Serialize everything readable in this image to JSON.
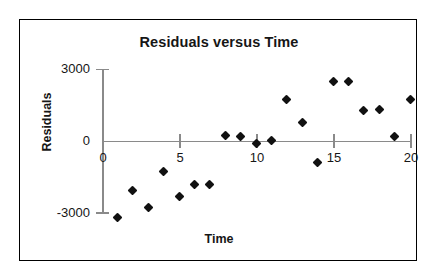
{
  "chart_data": {
    "type": "scatter",
    "title": "Residuals versus Time",
    "xlabel": "Time",
    "ylabel": "Residuals",
    "xlim": [
      0,
      20
    ],
    "ylim": [
      -3000,
      3000
    ],
    "grid": false,
    "legend": null,
    "xticks": [
      0,
      5,
      10,
      15,
      20
    ],
    "xtick_labels": [
      "0",
      "5",
      "10",
      "15",
      "20"
    ],
    "yticks": [
      -3000,
      0,
      3000
    ],
    "ytick_labels": [
      "3000",
      "0",
      "-3000"
    ],
    "series_name": "Residuals",
    "marker": "diamond",
    "marker_color": "#111111",
    "axis_color": "#8a8a8a",
    "points": [
      {
        "x": 1,
        "y": -3170
      },
      {
        "x": 2,
        "y": -2040
      },
      {
        "x": 3,
        "y": -2750
      },
      {
        "x": 4,
        "y": -1250
      },
      {
        "x": 5,
        "y": -2290
      },
      {
        "x": 6,
        "y": -1790
      },
      {
        "x": 7,
        "y": -1790
      },
      {
        "x": 8,
        "y": 250
      },
      {
        "x": 9,
        "y": 210
      },
      {
        "x": 10,
        "y": -80
      },
      {
        "x": 11,
        "y": 40
      },
      {
        "x": 12,
        "y": 1750
      },
      {
        "x": 13,
        "y": 790
      },
      {
        "x": 14,
        "y": -880
      },
      {
        "x": 15,
        "y": 2500
      },
      {
        "x": 16,
        "y": 2500
      },
      {
        "x": 17,
        "y": 1290
      },
      {
        "x": 18,
        "y": 1330
      },
      {
        "x": 19,
        "y": 210
      },
      {
        "x": 20,
        "y": 1750
      }
    ]
  },
  "chart": {
    "title": "Residuals versus Time",
    "xlabel": "Time",
    "ylabel": "Residuals",
    "ytick_labels": [
      "3000",
      "0",
      "-3000"
    ],
    "xtick_labels": [
      "0",
      "5",
      "10",
      "15",
      "20"
    ]
  }
}
